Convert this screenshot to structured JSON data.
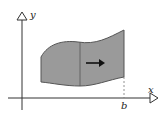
{
  "diagram": {
    "axes": {
      "x_label": "x",
      "y_label": "y"
    },
    "marks": {
      "b_label": "b"
    },
    "region": {
      "fill": "#9a9a9a",
      "stroke": "#555555",
      "description": "shaded region between two curves translated to the right"
    },
    "arrow": {
      "direction": "right",
      "color": "#111111"
    },
    "colors": {
      "axis": "#333333",
      "dashed": "#777777"
    }
  }
}
